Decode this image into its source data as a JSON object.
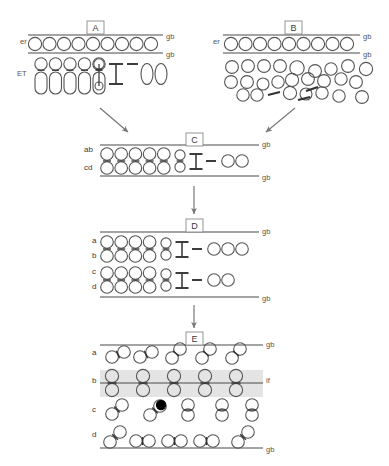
{
  "figure": {
    "background_color": "#ffffff",
    "stroke_color": "#555555",
    "dark_stroke_color": "#333333",
    "band_fill_color": "#e4e4e4",
    "filled_cell_color": "#000000",
    "width": 389,
    "height": 466
  },
  "panels": [
    {
      "id": "A",
      "label": "A",
      "label_box": {
        "x": 87,
        "y": 21,
        "w": 17,
        "h": 13
      },
      "side_labels": [
        {
          "name": "er",
          "text": "er",
          "x": 20,
          "y": 44
        },
        {
          "name": "ET",
          "text": "ET",
          "x": 17,
          "y": 76
        }
      ],
      "boundary_labels": [
        {
          "text": "gb",
          "x": 166,
          "y": 39
        },
        {
          "text": "gb",
          "x": 166,
          "y": 57
        }
      ],
      "lines": [
        {
          "name": "gb-top",
          "x1": 28,
          "y1": 35,
          "x2": 163,
          "y2": 35
        },
        {
          "name": "gb-bottom",
          "x1": 28,
          "y1": 53,
          "x2": 163,
          "y2": 53
        }
      ],
      "er_circles": {
        "count": 9,
        "start_x": 35,
        "y": 44,
        "step": 14.5,
        "r": 6.6
      },
      "et_units": {
        "count": 5,
        "start_x": 41,
        "top_y": 64,
        "step": 14.5,
        "top_r": 6.2,
        "body_w": 12,
        "body_h": 22,
        "body_y": 72
      },
      "et_small_unit": {
        "x": 99,
        "top_y": 64,
        "top_r": 5.2,
        "bot_y": 86,
        "bot_r": 4.0
      },
      "dumbbell": {
        "x": 116,
        "y_top": 64,
        "y_bot": 84,
        "half_w": 7
      },
      "dash": {
        "x1": 127,
        "y1": 64,
        "x2": 138,
        "y2": 64
      },
      "free_ovals": {
        "count": 2,
        "start_x": 147,
        "y": 74,
        "step": 14,
        "rx": 6.0,
        "ry": 10.5
      }
    },
    {
      "id": "B",
      "label": "B",
      "label_box": {
        "x": 285,
        "y": 21,
        "w": 17,
        "h": 13
      },
      "side_labels": [
        {
          "name": "er",
          "text": "er",
          "x": 213,
          "y": 44
        }
      ],
      "boundary_labels": [
        {
          "text": "gb",
          "x": 363,
          "y": 39
        },
        {
          "text": "gb",
          "x": 363,
          "y": 57
        }
      ],
      "lines": [
        {
          "name": "gb-top",
          "x1": 223,
          "y1": 35,
          "x2": 360,
          "y2": 35
        },
        {
          "name": "gb-bottom",
          "x1": 223,
          "y1": 53,
          "x2": 360,
          "y2": 53
        }
      ],
      "er_circles": {
        "count": 9,
        "start_x": 231,
        "y": 44,
        "step": 14.5,
        "r": 6.6
      },
      "scattered_cells": [
        {
          "x": 232,
          "y": 67,
          "r": 6.4
        },
        {
          "x": 248,
          "y": 66,
          "r": 6.4
        },
        {
          "x": 264,
          "y": 66,
          "r": 6.4
        },
        {
          "x": 280,
          "y": 66,
          "r": 6.4
        },
        {
          "x": 297,
          "y": 68,
          "r": 7.2
        },
        {
          "x": 315,
          "y": 71,
          "r": 6.4
        },
        {
          "x": 331,
          "y": 69,
          "r": 6.2
        },
        {
          "x": 348,
          "y": 66,
          "r": 6.4
        },
        {
          "x": 366,
          "y": 69,
          "r": 6.6
        },
        {
          "x": 231,
          "y": 82,
          "r": 6.4
        },
        {
          "x": 247,
          "y": 82,
          "r": 6.4
        },
        {
          "x": 263,
          "y": 84,
          "r": 6.0
        },
        {
          "x": 278,
          "y": 82,
          "r": 6.2
        },
        {
          "x": 292,
          "y": 80,
          "r": 6.6
        },
        {
          "x": 308,
          "y": 79,
          "r": 6.4
        },
        {
          "x": 324,
          "y": 81,
          "r": 6.4
        },
        {
          "x": 341,
          "y": 79,
          "r": 6.2
        },
        {
          "x": 356,
          "y": 82,
          "r": 6.4
        },
        {
          "x": 243,
          "y": 95,
          "r": 6.2
        },
        {
          "x": 257,
          "y": 95,
          "r": 6.2
        },
        {
          "x": 290,
          "y": 93,
          "r": 6.6
        },
        {
          "x": 306,
          "y": 94,
          "r": 6.0
        },
        {
          "x": 322,
          "y": 93,
          "r": 6.2
        },
        {
          "x": 339,
          "y": 96,
          "r": 6.2
        },
        {
          "x": 362,
          "y": 97,
          "r": 6.4
        }
      ],
      "dashes": [
        {
          "x1": 268,
          "y1": 95,
          "x2": 280,
          "y2": 92
        },
        {
          "x1": 298,
          "y1": 100,
          "x2": 310,
          "y2": 97
        },
        {
          "x1": 306,
          "y1": 91,
          "x2": 318,
          "y2": 87
        }
      ]
    },
    {
      "id": "C",
      "label": "C",
      "label_box": {
        "x": 186,
        "y": 133,
        "w": 17,
        "h": 13
      },
      "side_labels": [
        {
          "name": "ab",
          "text": "ab",
          "x": 84,
          "y": 152
        },
        {
          "name": "cd",
          "text": "cd",
          "x": 84,
          "y": 170
        }
      ],
      "boundary_labels": [
        {
          "text": "gb",
          "x": 262,
          "y": 147
        },
        {
          "text": "gb",
          "x": 262,
          "y": 180
        }
      ],
      "lines": [
        {
          "name": "gb-top",
          "x1": 100,
          "y1": 145,
          "x2": 259,
          "y2": 145
        },
        {
          "name": "gb-bottom",
          "x1": 100,
          "y1": 176,
          "x2": 259,
          "y2": 176
        }
      ],
      "paired_units": {
        "count": 5,
        "start_x": 107,
        "top_y": 154,
        "bot_y": 168,
        "step": 14.2,
        "r": 6.3
      },
      "small_pair": {
        "x": 180,
        "top_y": 155,
        "bot_y": 167,
        "r": 5.1
      },
      "dumbbell": {
        "x": 196,
        "y_top": 154,
        "y_bot": 169,
        "half_w": 6.5
      },
      "dash": {
        "x1": 206,
        "y1": 161,
        "x2": 216,
        "y2": 161
      },
      "free_circles": {
        "count": 2,
        "start_x": 228,
        "y": 161,
        "step": 14,
        "r": 6.3
      }
    },
    {
      "id": "D",
      "label": "D",
      "label_box": {
        "x": 186,
        "y": 219,
        "w": 17,
        "h": 13
      },
      "side_labels": [
        {
          "name": "a",
          "text": "a",
          "x": 92,
          "y": 243
        },
        {
          "name": "b",
          "text": "b",
          "x": 92,
          "y": 258
        },
        {
          "name": "c",
          "text": "c",
          "x": 92,
          "y": 274
        },
        {
          "name": "d",
          "text": "d",
          "x": 92,
          "y": 289
        }
      ],
      "boundary_labels": [
        {
          "text": "gb",
          "x": 262,
          "y": 234
        },
        {
          "text": "gb",
          "x": 262,
          "y": 301
        }
      ],
      "lines": [
        {
          "name": "gb-top",
          "x1": 100,
          "y1": 232,
          "x2": 259,
          "y2": 232
        },
        {
          "name": "gb-bottom",
          "x1": 100,
          "y1": 297,
          "x2": 259,
          "y2": 297
        }
      ],
      "groups": [
        {
          "name": "ab-group",
          "paired_units": {
            "count": 4,
            "start_x": 107,
            "top_y": 242,
            "bot_y": 256,
            "step": 14.2,
            "r": 6.3
          },
          "small_pair": {
            "x": 166,
            "top_y": 243,
            "bot_y": 255,
            "r": 5.1
          },
          "dumbbell": {
            "x": 182,
            "y_top": 242,
            "y_bot": 257,
            "half_w": 6.5
          },
          "dash": {
            "x1": 192,
            "y1": 249,
            "x2": 202,
            "y2": 249
          },
          "free_circles": {
            "count": 3,
            "start_x": 214,
            "y": 249,
            "step": 14,
            "r": 6.3
          }
        },
        {
          "name": "cd-group",
          "paired_units": {
            "count": 4,
            "start_x": 107,
            "top_y": 273,
            "bot_y": 287,
            "step": 14.2,
            "r": 6.3
          },
          "small_pair": {
            "x": 166,
            "top_y": 274,
            "bot_y": 286,
            "r": 5.1
          },
          "dumbbell": {
            "x": 182,
            "y_top": 273,
            "y_bot": 288,
            "half_w": 6.5
          },
          "dash": {
            "x1": 192,
            "y1": 280,
            "x2": 202,
            "y2": 280
          },
          "free_circles": {
            "count": 2,
            "start_x": 214,
            "y": 280,
            "step": 14,
            "r": 6.3
          }
        }
      ]
    },
    {
      "id": "E",
      "label": "E",
      "label_box": {
        "x": 186,
        "y": 332,
        "w": 17,
        "h": 13
      },
      "side_labels": [
        {
          "name": "a",
          "text": "a",
          "x": 92,
          "y": 355
        },
        {
          "name": "b",
          "text": "b",
          "x": 92,
          "y": 383
        },
        {
          "name": "c",
          "text": "c",
          "x": 92,
          "y": 412
        },
        {
          "name": "d",
          "text": "d",
          "x": 92,
          "y": 437
        }
      ],
      "boundary_labels": [
        {
          "text": "gb",
          "x": 266,
          "y": 347
        },
        {
          "text": "if",
          "x": 266,
          "y": 383
        },
        {
          "text": "gb",
          "x": 266,
          "y": 452
        }
      ],
      "lines": [
        {
          "name": "gb-top",
          "x1": 100,
          "y1": 345,
          "x2": 263,
          "y2": 345
        },
        {
          "name": "if-line",
          "x1": 100,
          "y1": 383,
          "x2": 263,
          "y2": 383
        },
        {
          "name": "gb-bottom",
          "x1": 100,
          "y1": 448,
          "x2": 263,
          "y2": 448
        }
      ],
      "band": {
        "name": "if-band",
        "x": 100,
        "y": 370,
        "w": 163,
        "h": 27
      },
      "row_a": {
        "pairs": [
          {
            "x1": 112,
            "y1": 357,
            "x2": 124,
            "y2": 352
          },
          {
            "x1": 140,
            "y1": 357,
            "x2": 152,
            "y2": 352
          },
          {
            "x1": 172,
            "y1": 358,
            "x2": 180,
            "y2": 349
          },
          {
            "x1": 202,
            "y1": 358,
            "x2": 210,
            "y2": 349
          },
          {
            "x1": 232,
            "y1": 358,
            "x2": 240,
            "y2": 349
          }
        ],
        "r": 6.3
      },
      "row_b": {
        "units": {
          "count": 5,
          "start_x": 112,
          "top_y": 376,
          "bot_y": 390,
          "step": 31,
          "r": 6.6
        }
      },
      "row_c": {
        "pairs": [
          {
            "x1": 112,
            "y1": 414,
            "x2": 122,
            "y2": 405
          },
          {
            "x1": 150,
            "y1": 415,
            "x2": 160,
            "y2": 406
          },
          {
            "x1": 188,
            "y1": 415,
            "x2": 188,
            "y2": 405
          },
          {
            "x1": 222,
            "y1": 415,
            "x2": 222,
            "y2": 405
          },
          {
            "x1": 252,
            "y1": 415,
            "x2": 252,
            "y2": 405
          }
        ],
        "r": 6.3,
        "filled_cell": {
          "x": 161,
          "y": 405,
          "r": 4.6
        }
      },
      "row_d": {
        "pairs": [
          {
            "x1": 110,
            "y1": 442,
            "x2": 120,
            "y2": 432
          },
          {
            "x1": 136,
            "y1": 441,
            "x2": 149,
            "y2": 441
          },
          {
            "x1": 168,
            "y1": 441,
            "x2": 181,
            "y2": 441
          },
          {
            "x1": 200,
            "y1": 441,
            "x2": 213,
            "y2": 441
          },
          {
            "x1": 238,
            "y1": 442,
            "x2": 248,
            "y2": 432
          }
        ],
        "r": 6.3
      }
    }
  ],
  "arrows": [
    {
      "name": "arrow-a-to-c",
      "x1": 100,
      "y1": 108,
      "x2": 128,
      "y2": 132
    },
    {
      "name": "arrow-b-to-c",
      "x1": 295,
      "y1": 108,
      "x2": 266,
      "y2": 132
    },
    {
      "name": "arrow-c-to-d",
      "x1": 194,
      "y1": 186,
      "x2": 194,
      "y2": 214
    },
    {
      "name": "arrow-d-to-e",
      "x1": 194,
      "y1": 305,
      "x2": 194,
      "y2": 328
    }
  ]
}
